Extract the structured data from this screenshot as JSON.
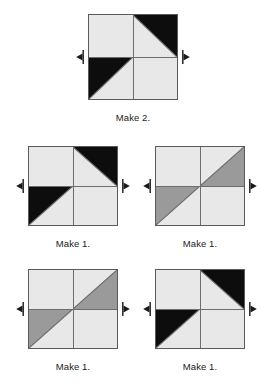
{
  "document": {
    "kind": "quilt-block-assembly-diagram",
    "background": "#ffffff"
  },
  "palette": {
    "light": "#e8e8e8",
    "medium_gray": "#9a9a9a",
    "dark": "#0d0d0d",
    "seam_line": "#6d6d6d",
    "block_outline": "#5a5a5a",
    "arrow": "#1a1a1a",
    "text": "#1a1a1a"
  },
  "blocks": [
    {
      "id": "block-top",
      "caption": "Make 2.",
      "accent_color": "#0d0d0d",
      "x": 88,
      "y": 14,
      "width": 90,
      "height": 86,
      "arrows": {
        "left": "left",
        "right": "right"
      },
      "quadrants": [
        {
          "position": "top-left",
          "type": "solid",
          "fill": "light"
        },
        {
          "position": "top-right",
          "type": "half-square-triangle",
          "accent_corner": "upper-right",
          "fill": "accent"
        },
        {
          "position": "bottom-left",
          "type": "half-square-triangle",
          "accent_corner": "upper-left",
          "fill": "accent"
        },
        {
          "position": "bottom-right",
          "type": "solid",
          "fill": "light"
        }
      ]
    },
    {
      "id": "block-middle-left",
      "caption": "Make 1.",
      "accent_color": "#0d0d0d",
      "x": 28,
      "y": 146,
      "width": 90,
      "height": 80,
      "arrows": {
        "left": "left",
        "right": "right"
      },
      "quadrants": [
        {
          "position": "top-left",
          "type": "solid",
          "fill": "light"
        },
        {
          "position": "top-right",
          "type": "half-square-triangle",
          "accent_corner": "upper-right",
          "fill": "accent"
        },
        {
          "position": "bottom-left",
          "type": "half-square-triangle",
          "accent_corner": "upper-left",
          "fill": "accent"
        },
        {
          "position": "bottom-right",
          "type": "solid",
          "fill": "light"
        }
      ]
    },
    {
      "id": "block-middle-right",
      "caption": "Make 1.",
      "accent_color": "#9a9a9a",
      "x": 155,
      "y": 146,
      "width": 90,
      "height": 80,
      "arrows": {
        "left": "left",
        "right": "right"
      },
      "quadrants": [
        {
          "position": "top-left",
          "type": "solid",
          "fill": "light"
        },
        {
          "position": "top-right",
          "type": "half-square-triangle",
          "accent_corner": "lower-right",
          "fill": "accent"
        },
        {
          "position": "bottom-left",
          "type": "half-square-triangle",
          "accent_corner": "upper-left",
          "fill": "accent"
        },
        {
          "position": "bottom-right",
          "type": "solid",
          "fill": "light"
        }
      ]
    },
    {
      "id": "block-bottom-left",
      "caption": "Make 1.",
      "accent_color": "#9a9a9a",
      "x": 28,
      "y": 269,
      "width": 90,
      "height": 80,
      "arrows": {
        "left": "left",
        "right": "right"
      },
      "quadrants": [
        {
          "position": "top-left",
          "type": "solid",
          "fill": "light"
        },
        {
          "position": "top-right",
          "type": "half-square-triangle",
          "accent_corner": "lower-right",
          "fill": "accent"
        },
        {
          "position": "bottom-left",
          "type": "half-square-triangle",
          "accent_corner": "upper-left",
          "fill": "accent"
        },
        {
          "position": "bottom-right",
          "type": "solid",
          "fill": "light"
        }
      ]
    },
    {
      "id": "block-bottom-right",
      "caption": "Make 1.",
      "accent_color": "#0d0d0d",
      "x": 155,
      "y": 269,
      "width": 90,
      "height": 80,
      "arrows": {
        "left": "left",
        "right": "right"
      },
      "quadrants": [
        {
          "position": "top-left",
          "type": "solid",
          "fill": "light"
        },
        {
          "position": "top-right",
          "type": "half-square-triangle",
          "accent_corner": "upper-right",
          "fill": "accent"
        },
        {
          "position": "bottom-left",
          "type": "half-square-triangle",
          "accent_corner": "upper-left",
          "fill": "accent"
        },
        {
          "position": "bottom-right",
          "type": "solid",
          "fill": "light"
        }
      ]
    }
  ]
}
